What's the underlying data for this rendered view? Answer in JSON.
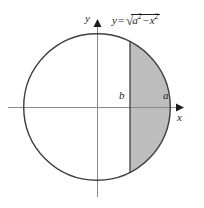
{
  "figure": {
    "type": "geometry-diagram",
    "background_color": "#ffffff",
    "axes": {
      "x_axis_label": "x",
      "y_axis_label": "y",
      "axis_color": "#8a8a8a",
      "arrow_color": "#1c1c1c",
      "origin_x": 97,
      "origin_y": 107,
      "x_axis_start": 8,
      "x_axis_end": 182,
      "y_axis_start": 22,
      "y_axis_end": 197
    },
    "circle": {
      "center_x": 97,
      "center_y": 107,
      "radius": 74,
      "stroke_color": "#3f3f3f",
      "stroke_width": 1.4,
      "fill_color": "none"
    },
    "shaded_region": {
      "fill_color": "#bdbdbd",
      "chord_x": 130,
      "chord_color": "#3f3f3f",
      "from_label": "b",
      "to_label": "a"
    },
    "labels": {
      "y_axis": "y",
      "x_axis": "x",
      "lower_bound": "b",
      "upper_bound": "a"
    },
    "equation": {
      "lhs": "y",
      "equals": "=",
      "radical_sign": "√",
      "term1_base": "a",
      "term1_exp": "2",
      "minus": "−",
      "term2_base": "x",
      "term2_exp": "2",
      "plain_text": "y = √(a² − x²)"
    }
  }
}
